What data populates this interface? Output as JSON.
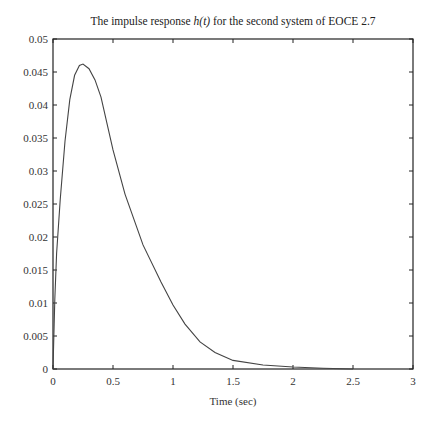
{
  "chart_data": {
    "type": "line",
    "title_prefix": "The impulse response ",
    "title_func": "h(t)",
    "title_suffix": " for the second system of EOCE 2.7",
    "xlabel": "Time (sec)",
    "ylabel": "",
    "xlim": [
      0,
      3
    ],
    "ylim": [
      0,
      0.05
    ],
    "xticks": [
      "0",
      "0.5",
      "1",
      "1.5",
      "2",
      "2.5",
      "3"
    ],
    "yticks": [
      "0",
      "0.005",
      "0.01",
      "0.015",
      "0.02",
      "0.025",
      "0.03",
      "0.035",
      "0.04",
      "0.045",
      "0.05"
    ],
    "grid": false,
    "legend": null,
    "series": [
      {
        "name": "h(t)",
        "color": "#444444",
        "x": [
          0,
          0.015,
          0.03,
          0.06,
          0.1,
          0.14,
          0.18,
          0.22,
          0.25,
          0.3,
          0.35,
          0.4,
          0.5,
          0.6,
          0.75,
          0.9,
          1.0,
          1.1,
          1.225,
          1.35,
          1.5,
          1.75,
          2.0,
          2.25,
          2.5
        ],
        "y": [
          0,
          0.0105,
          0.0175,
          0.0256,
          0.0345,
          0.0408,
          0.0445,
          0.046,
          0.0462,
          0.0455,
          0.0438,
          0.0412,
          0.0332,
          0.0265,
          0.0188,
          0.0132,
          0.0097,
          0.0068,
          0.0041,
          0.0025,
          0.0013,
          0.0006,
          0.0003,
          0.0001,
          0.0
        ]
      }
    ]
  }
}
